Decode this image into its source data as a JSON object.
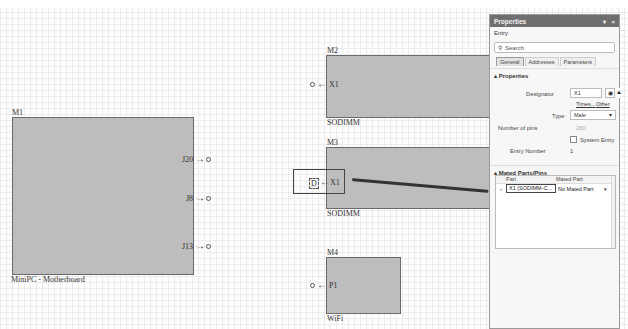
{
  "canvas": {
    "modules": [
      {
        "id": "M1",
        "designator": "M1",
        "name": "MiniPC - Motherboard",
        "pins": [
          {
            "label": "J20",
            "direction": "out"
          },
          {
            "label": "J8",
            "direction": "out"
          },
          {
            "label": "J13",
            "direction": "out"
          }
        ]
      },
      {
        "id": "M2",
        "designator": "M2",
        "name": "SODIMM",
        "pins": [
          {
            "label": "X1",
            "direction": "in"
          }
        ]
      },
      {
        "id": "M3",
        "designator": "M3",
        "name": "SODIMM",
        "pins": [
          {
            "label": "X1",
            "direction": "in"
          }
        ]
      },
      {
        "id": "M4",
        "designator": "M4",
        "name": "WiFi",
        "pins": [
          {
            "label": "P1",
            "direction": "in"
          }
        ]
      }
    ]
  },
  "properties_panel": {
    "title": "Properties",
    "controls": {
      "pin": "▾",
      "close": "×"
    },
    "object_type": "Entry",
    "search_placeholder": "Search",
    "tabs": [
      {
        "label": "General",
        "active": true
      },
      {
        "label": "Addresses",
        "active": false
      },
      {
        "label": "Parameters",
        "active": false
      }
    ],
    "properties_section": {
      "title": "Properties",
      "designator_label": "Designator",
      "designator_value": "X1",
      "times_link": "Times...",
      "other_link": "Other",
      "type_label": "Type",
      "type_value": "Male",
      "num_pins_label": "Number of pins",
      "num_pins_value": "260",
      "system_entry_label": "System Entry",
      "system_entry_checked": false,
      "entry_number_label": "Entry Number",
      "entry_number_value": "1"
    },
    "mated_section": {
      "title": "Mated Parts/Pins",
      "columns": [
        "Part",
        "Mated Part"
      ],
      "rows": [
        {
          "part": "X1 (SODIMM-C...",
          "mated_part": "No Mated Part"
        }
      ]
    }
  }
}
